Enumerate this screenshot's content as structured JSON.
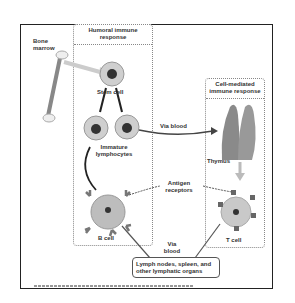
{
  "diagram": {
    "bone_marrow_label": "Bone\nmarrow",
    "humoral_panel": {
      "title": "Humoral immune response"
    },
    "cell_mediated_panel": {
      "title": "Cell-mediated immune response"
    },
    "labels": {
      "stem_cell": "Stem cell",
      "immature_lymphocytes": "Immature lymphocytes",
      "via_blood_top": "Via blood",
      "thymus": "Thymus",
      "antigen_receptors": "Antigen receptors",
      "b_cell": "B cell",
      "t_cell": "T cell",
      "via_blood_bottom": "Via blood",
      "lymph_organs": "Lymph nodes, spleen, and other lymphatic organs"
    },
    "credit": "Copyright © Pearson Education, Inc., publishing as Benjamin Cummings",
    "colors": {
      "frame": "#222222",
      "cell_fill": "#bdbdbd",
      "nucleus": "#333333",
      "thymus": "#8a8a8a"
    }
  }
}
